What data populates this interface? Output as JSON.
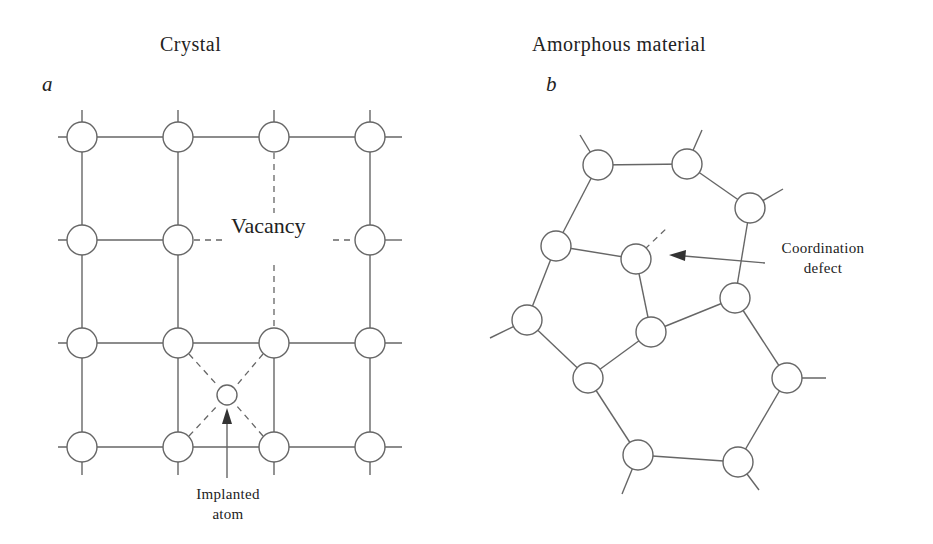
{
  "panels": [
    {
      "id": "a",
      "title": "Crystal",
      "letter": "a",
      "annotations": {
        "vacancy": "Vacancy",
        "implanted_line1": "Implanted",
        "implanted_line2": "atom"
      },
      "grid": {
        "columns_x": [
          82,
          178,
          274,
          370
        ],
        "rows_y": [
          137,
          240,
          343,
          447
        ],
        "atom_radius": 15,
        "vacancy_position": [
          274,
          240
        ],
        "implanted_atom": {
          "x": 227,
          "y": 395,
          "radius": 10
        }
      }
    },
    {
      "id": "b",
      "title": "Amorphous material",
      "letter": "b",
      "annotations": {
        "defect_line1": "Coordination",
        "defect_line2": "defect"
      },
      "atoms": [
        {
          "x": 598,
          "y": 165
        },
        {
          "x": 687,
          "y": 164
        },
        {
          "x": 750,
          "y": 208
        },
        {
          "x": 556,
          "y": 246
        },
        {
          "x": 636,
          "y": 259
        },
        {
          "x": 735,
          "y": 298
        },
        {
          "x": 527,
          "y": 320
        },
        {
          "x": 651,
          "y": 332
        },
        {
          "x": 588,
          "y": 378
        },
        {
          "x": 787,
          "y": 378
        },
        {
          "x": 638,
          "y": 455
        },
        {
          "x": 738,
          "y": 462
        }
      ]
    }
  ],
  "colors": {
    "line": "#666666",
    "text": "#222222",
    "background": "#ffffff"
  }
}
